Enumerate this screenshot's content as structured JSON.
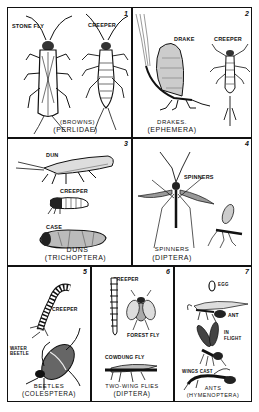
{
  "plate": {
    "panels": [
      {
        "number": "1",
        "labels": [
          "STONE FLY",
          "CREEPER"
        ],
        "caption_line1": "(BROWNS)",
        "caption_line2": "(PERLIDAE)"
      },
      {
        "number": "2",
        "labels": [
          "DRAKE",
          "CREEPER"
        ],
        "caption_line1": "DRAKES.",
        "caption_line2": "(EPHEMERA)"
      },
      {
        "number": "3",
        "labels": [
          "DUN",
          "CREEPER",
          "CASE"
        ],
        "caption_line1": "DUNS",
        "caption_line2": "(TRICHOPTERA)"
      },
      {
        "number": "4",
        "labels": [
          "SPINNERS"
        ],
        "caption_line1": "SPINNERS",
        "caption_line2": "(DIPTERA)"
      },
      {
        "number": "5",
        "labels": [
          "CREEPER",
          "WATER BEETLE"
        ],
        "caption_line1": "BEETLES",
        "caption_line2": "(COLESPTERA)"
      },
      {
        "number": "6",
        "labels": [
          "CREEPER",
          "FOREST FLY",
          "COWDUNG FLY"
        ],
        "caption_line1": "TWO-WING FLIES",
        "caption_line2": "(DIPTERA)"
      },
      {
        "number": "7",
        "labels": [
          "EGG",
          "ANT",
          "IN FLIGHT",
          "WINGS CAST"
        ],
        "caption_line1": "ANTS",
        "caption_line2": "(HYMENOPTERA)"
      }
    ],
    "ink_color": "#111111",
    "paper_color": "#ffffff"
  }
}
